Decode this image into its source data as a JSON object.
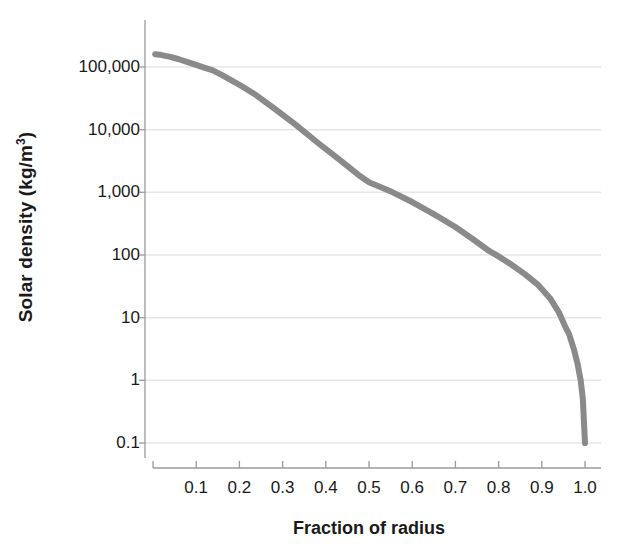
{
  "chart_data": {
    "type": "line",
    "title": "",
    "xlabel": "Fraction of radius",
    "ylabel": "Solar density (kg/m3)",
    "ylabel_display": "Solar density (kg/m",
    "ylabel_exponent": "3",
    "ylabel_suffix": ")",
    "yscale": "log",
    "xscale": "linear",
    "xlim": [
      0.0,
      1.0
    ],
    "ylim": [
      0.1,
      300000
    ],
    "grid": true,
    "legend": null,
    "xticks": [
      0.1,
      0.2,
      0.3,
      0.4,
      0.5,
      0.6,
      0.7,
      0.8,
      0.9,
      1.0
    ],
    "xtick_labels": [
      "0.1",
      "0.2",
      "0.3",
      "0.4",
      "0.5",
      "0.6",
      "0.7",
      "0.8",
      "0.9",
      "1.0"
    ],
    "yticks": [
      100000,
      10000,
      1000,
      100,
      10,
      1,
      0.1
    ],
    "ytick_labels": [
      "100,000",
      "10,000",
      "1,000",
      "100",
      "10",
      "1",
      "0.1"
    ],
    "series": [
      {
        "name": "Solar density profile",
        "color": "#8a8a8a",
        "line_width": 6,
        "x": [
          0.005,
          0.02,
          0.04,
          0.06,
          0.08,
          0.1,
          0.12,
          0.137,
          0.16,
          0.2,
          0.24,
          0.28,
          0.33,
          0.38,
          0.43,
          0.48,
          0.5,
          0.555,
          0.6,
          0.65,
          0.7,
          0.74,
          0.775,
          0.8,
          0.83,
          0.86,
          0.89,
          0.92,
          0.94,
          0.955,
          0.963,
          0.975,
          0.983,
          0.99,
          0.995,
          1.0
        ],
        "y": [
          160000,
          155000,
          145000,
          133000,
          120000,
          108000,
          97000,
          89000,
          74000,
          52000,
          35000,
          22000,
          12000,
          6300,
          3400,
          1800,
          1450,
          1000,
          700,
          450,
          280,
          180,
          120,
          95,
          70,
          50,
          34,
          20,
          12,
          7,
          5.5,
          3.0,
          1.8,
          1.0,
          0.5,
          0.1
        ]
      }
    ],
    "annotations": []
  },
  "axes": {
    "x_axis_line_color": "#4d4d4d",
    "y_axis_line_color": "#4d4d4d",
    "grid_color": "#e8e8e8",
    "tick_color": "#4d4d4d",
    "background": "#ffffff"
  }
}
